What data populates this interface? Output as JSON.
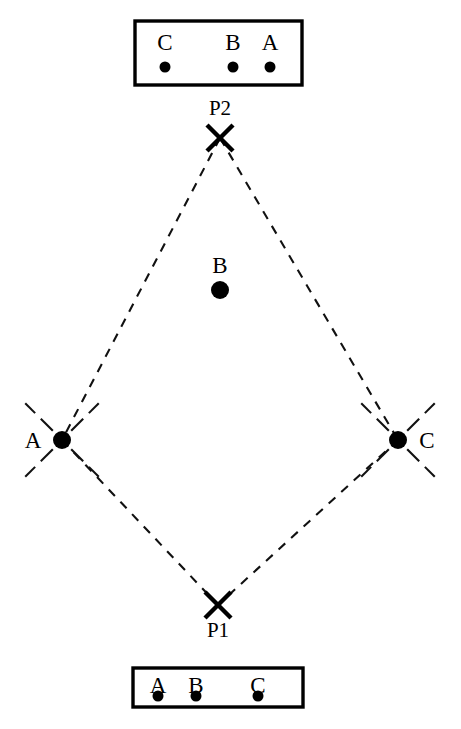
{
  "figure": {
    "background_color": "#ffffff",
    "ink_color": "#000000",
    "width": 461,
    "height": 729
  },
  "top_screen": {
    "name": "top-screen-box",
    "border_color": "#000000",
    "box": {
      "x": 135,
      "y": 21,
      "width": 167,
      "height": 64
    },
    "marks": [
      {
        "label": "C",
        "dot_x": 165,
        "label_x": 165
      },
      {
        "label": "B",
        "dot_x": 233,
        "label_x": 233
      },
      {
        "label": "A",
        "dot_x": 270,
        "label_x": 270
      }
    ],
    "label_y": 42,
    "dot_y": 67,
    "dot_radius": 5.5
  },
  "bottom_screen": {
    "name": "bottom-screen-box",
    "border_color": "#000000",
    "box": {
      "x": 133,
      "y": 668,
      "width": 170,
      "height": 39
    },
    "marks": [
      {
        "label": "A",
        "dot_x": 158,
        "label_x": 158
      },
      {
        "label": "B",
        "dot_x": 196,
        "label_x": 196
      },
      {
        "label": "C",
        "dot_x": 258,
        "label_x": 258
      }
    ],
    "label_y": 675,
    "dot_y": 696,
    "dot_radius": 5.5
  },
  "pinholes": [
    {
      "id": "P2",
      "label": "P2",
      "marker": "x-marker",
      "x": 220,
      "y": 138,
      "label_x": 220,
      "label_y": 108,
      "size": 13
    },
    {
      "id": "P1",
      "label": "P1",
      "marker": "x-marker",
      "x": 218,
      "y": 605,
      "label_x": 218,
      "label_y": 630,
      "size": 13
    }
  ],
  "object_points": [
    {
      "id": "A",
      "label": "A",
      "x": 62,
      "y": 440,
      "radius": 9,
      "label_x": 33,
      "label_y": 440,
      "has_cross_dashes": true
    },
    {
      "id": "B",
      "label": "B",
      "x": 220,
      "y": 290,
      "radius": 9,
      "label_x": 220,
      "label_y": 265,
      "has_cross_dashes": false
    },
    {
      "id": "C",
      "label": "C",
      "x": 398,
      "y": 440,
      "radius": 9,
      "label_x": 427,
      "label_y": 440,
      "has_cross_dashes": true
    }
  ],
  "rays": [
    {
      "id": "ray-P2-A",
      "from": "P2",
      "to": "A",
      "x1": 220,
      "y1": 138,
      "x2": 62,
      "y2": 440,
      "style": "dashed"
    },
    {
      "id": "ray-P2-C",
      "from": "P2",
      "to": "C",
      "x1": 220,
      "y1": 138,
      "x2": 398,
      "y2": 440,
      "style": "dashed"
    },
    {
      "id": "ray-A-P1",
      "from": "A",
      "to": "P1",
      "x1": 62,
      "y1": 440,
      "x2": 218,
      "y2": 605,
      "style": "dashed"
    },
    {
      "id": "ray-C-P1",
      "from": "C",
      "to": "P1",
      "x1": 398,
      "y1": 440,
      "x2": 218,
      "y2": 605,
      "style": "dashed"
    }
  ],
  "ray_style": {
    "dash_pattern": "9 8",
    "stroke_width": 2.1,
    "color": "#111111"
  }
}
